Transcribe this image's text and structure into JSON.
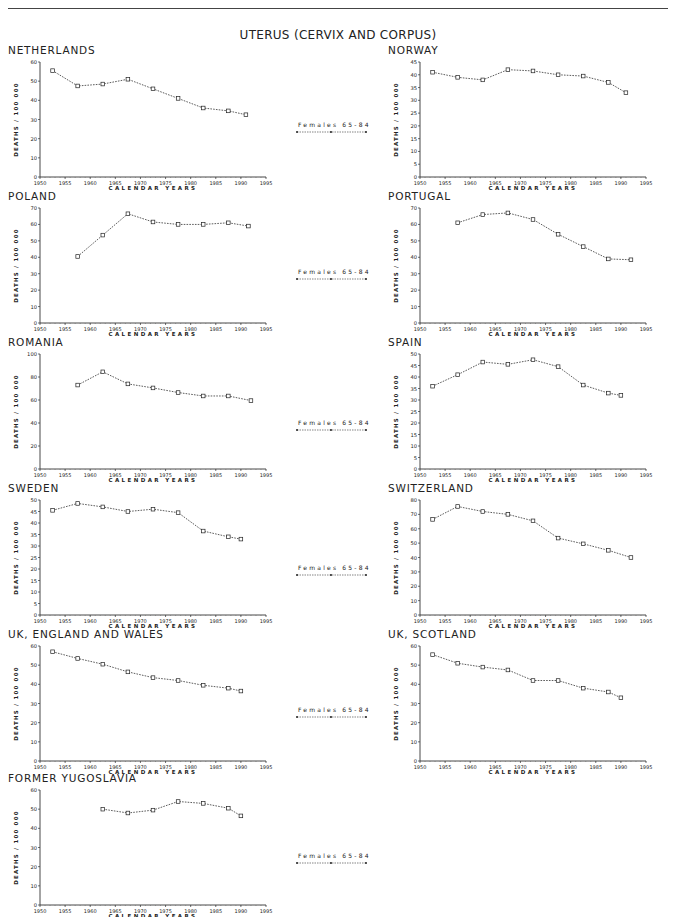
{
  "page": {
    "title": "UTERUS (CERVIX AND CORPUS)",
    "legend_label": "Females 65-84"
  },
  "chart_data": [
    {
      "type": "line",
      "title": "NETHERLANDS",
      "xlabel": "CALENDAR YEARS",
      "ylabel": "DEATHS / 100 000",
      "xlim": [
        1950,
        1995
      ],
      "ylim": [
        0,
        60
      ],
      "yticks": [
        0,
        10,
        20,
        30,
        40,
        50,
        60
      ],
      "xticks": [
        1950,
        1955,
        1960,
        1965,
        1970,
        1975,
        1980,
        1985,
        1990,
        1995
      ],
      "grid": false,
      "series": [
        {
          "name": "Females 65-84",
          "x": [
            1952.5,
            1957.5,
            1962.5,
            1967.5,
            1972.5,
            1977.5,
            1982.5,
            1987.5,
            1991
          ],
          "values": [
            55.5,
            47.5,
            48.5,
            51,
            46,
            41,
            36,
            34.5,
            32.5
          ]
        }
      ]
    },
    {
      "type": "line",
      "title": "NORWAY",
      "xlabel": "CALENDAR YEARS",
      "ylabel": "DEATHS / 100 000",
      "xlim": [
        1950,
        1995
      ],
      "ylim": [
        0,
        45
      ],
      "yticks": [
        0,
        5,
        10,
        15,
        20,
        25,
        30,
        35,
        40,
        45
      ],
      "xticks": [
        1950,
        1955,
        1960,
        1965,
        1970,
        1975,
        1980,
        1985,
        1990,
        1995
      ],
      "grid": false,
      "series": [
        {
          "name": "Females 65-84",
          "x": [
            1952.5,
            1957.5,
            1962.5,
            1967.5,
            1972.5,
            1977.5,
            1982.5,
            1987.5,
            1991
          ],
          "values": [
            41,
            39,
            38,
            42,
            41.5,
            40,
            39.5,
            37,
            33
          ]
        }
      ]
    },
    {
      "type": "line",
      "title": "POLAND",
      "xlabel": "CALENDAR YEARS",
      "ylabel": "DEATHS / 100 000",
      "xlim": [
        1950,
        1995
      ],
      "ylim": [
        0,
        70
      ],
      "yticks": [
        0,
        10,
        20,
        30,
        40,
        50,
        60,
        70
      ],
      "xticks": [
        1950,
        1955,
        1960,
        1965,
        1970,
        1975,
        1980,
        1985,
        1990,
        1995
      ],
      "grid": false,
      "series": [
        {
          "name": "Females 65-84",
          "x": [
            1957.5,
            1962.5,
            1967.5,
            1972.5,
            1977.5,
            1982.5,
            1987.5,
            1991.5
          ],
          "values": [
            40.5,
            53.5,
            66.5,
            61.5,
            60,
            60,
            61,
            59
          ]
        }
      ]
    },
    {
      "type": "line",
      "title": "PORTUGAL",
      "xlabel": "CALENDAR YEARS",
      "ylabel": "DEATHS / 100 000",
      "xlim": [
        1950,
        1995
      ],
      "ylim": [
        0,
        70
      ],
      "yticks": [
        0,
        10,
        20,
        30,
        40,
        50,
        60,
        70
      ],
      "xticks": [
        1950,
        1955,
        1960,
        1965,
        1970,
        1975,
        1980,
        1985,
        1990,
        1995
      ],
      "grid": false,
      "series": [
        {
          "name": "Females 65-84",
          "x": [
            1957.5,
            1962.5,
            1967.5,
            1972.5,
            1977.5,
            1982.5,
            1987.5,
            1992
          ],
          "values": [
            61,
            66,
            67,
            63,
            54,
            46.5,
            39,
            38.5
          ]
        }
      ]
    },
    {
      "type": "line",
      "title": "ROMANIA",
      "xlabel": "CALENDAR YEARS",
      "ylabel": "DEATHS / 100 000",
      "xlim": [
        1950,
        1995
      ],
      "ylim": [
        0,
        100
      ],
      "yticks": [
        0,
        20,
        40,
        60,
        80,
        100
      ],
      "xticks": [
        1950,
        1955,
        1960,
        1965,
        1970,
        1975,
        1980,
        1985,
        1990,
        1995
      ],
      "grid": false,
      "series": [
        {
          "name": "Females 65-84",
          "x": [
            1957.5,
            1962.5,
            1967.5,
            1972.5,
            1977.5,
            1982.5,
            1987.5,
            1992
          ],
          "values": [
            73,
            84.5,
            74,
            70.5,
            66.5,
            63.5,
            63.5,
            59.5
          ]
        }
      ]
    },
    {
      "type": "line",
      "title": "SPAIN",
      "xlabel": "CALENDAR YEARS",
      "ylabel": "DEATHS / 100 000",
      "xlim": [
        1950,
        1995
      ],
      "ylim": [
        0,
        50
      ],
      "yticks": [
        0,
        5,
        10,
        15,
        20,
        25,
        30,
        35,
        40,
        45,
        50
      ],
      "xticks": [
        1950,
        1955,
        1960,
        1965,
        1970,
        1975,
        1980,
        1985,
        1990,
        1995
      ],
      "grid": false,
      "series": [
        {
          "name": "Females 65-84",
          "x": [
            1952.5,
            1957.5,
            1962.5,
            1967.5,
            1972.5,
            1977.5,
            1982.5,
            1987.5,
            1990
          ],
          "values": [
            36,
            41,
            46.5,
            45.5,
            47.5,
            44.5,
            36.5,
            33,
            32
          ]
        }
      ]
    },
    {
      "type": "line",
      "title": "SWEDEN",
      "xlabel": "CALENDAR YEARS",
      "ylabel": "DEATHS / 100 000",
      "xlim": [
        1950,
        1995
      ],
      "ylim": [
        0,
        50
      ],
      "yticks": [
        0,
        5,
        10,
        15,
        20,
        25,
        30,
        35,
        40,
        45,
        50
      ],
      "xticks": [
        1950,
        1955,
        1960,
        1965,
        1970,
        1975,
        1980,
        1985,
        1990,
        1995
      ],
      "grid": false,
      "series": [
        {
          "name": "Females 65-84",
          "x": [
            1952.5,
            1957.5,
            1962.5,
            1967.5,
            1972.5,
            1977.5,
            1982.5,
            1987.5,
            1990
          ],
          "values": [
            45.5,
            48.5,
            47,
            45,
            46,
            44.5,
            36.5,
            34,
            33
          ]
        }
      ]
    },
    {
      "type": "line",
      "title": "SWITZERLAND",
      "xlabel": "CALENDAR YEARS",
      "ylabel": "DEATHS / 100 000",
      "xlim": [
        1950,
        1995
      ],
      "ylim": [
        0,
        80
      ],
      "yticks": [
        0,
        10,
        20,
        30,
        40,
        50,
        60,
        70,
        80
      ],
      "xticks": [
        1950,
        1955,
        1960,
        1965,
        1970,
        1975,
        1980,
        1985,
        1990,
        1995
      ],
      "grid": false,
      "series": [
        {
          "name": "Females 65-84",
          "x": [
            1952.5,
            1957.5,
            1962.5,
            1967.5,
            1972.5,
            1977.5,
            1982.5,
            1987.5,
            1992
          ],
          "values": [
            66.5,
            75.5,
            72,
            70,
            65.5,
            53.5,
            49.5,
            45,
            40
          ]
        }
      ]
    },
    {
      "type": "line",
      "title": "UK, ENGLAND AND WALES",
      "xlabel": "CALENDAR YEARS",
      "ylabel": "DEATHS / 100 000",
      "xlim": [
        1950,
        1995
      ],
      "ylim": [
        0,
        60
      ],
      "yticks": [
        0,
        10,
        20,
        30,
        40,
        50,
        60
      ],
      "xticks": [
        1950,
        1955,
        1960,
        1965,
        1970,
        1975,
        1980,
        1985,
        1990,
        1995
      ],
      "grid": false,
      "series": [
        {
          "name": "Females 65-84",
          "x": [
            1952.5,
            1957.5,
            1962.5,
            1967.5,
            1972.5,
            1977.5,
            1982.5,
            1987.5,
            1990
          ],
          "values": [
            57,
            53.5,
            50.5,
            46.5,
            43.5,
            42,
            39.5,
            38,
            36.5
          ]
        }
      ]
    },
    {
      "type": "line",
      "title": "UK, SCOTLAND",
      "xlabel": "CALENDAR YEARS",
      "ylabel": "DEATHS / 100 000",
      "xlim": [
        1950,
        1995
      ],
      "ylim": [
        0,
        60
      ],
      "yticks": [
        0,
        10,
        20,
        30,
        40,
        50,
        60
      ],
      "xticks": [
        1950,
        1955,
        1960,
        1965,
        1970,
        1975,
        1980,
        1985,
        1990,
        1995
      ],
      "grid": false,
      "series": [
        {
          "name": "Females 65-84",
          "x": [
            1952.5,
            1957.5,
            1962.5,
            1967.5,
            1972.5,
            1977.5,
            1982.5,
            1987.5,
            1990
          ],
          "values": [
            55.5,
            51,
            49,
            47.5,
            42,
            42,
            38,
            36,
            33
          ]
        }
      ]
    },
    {
      "type": "line",
      "title": "FORMER YUGOSLAVIA",
      "xlabel": "CALENDAR YEARS",
      "ylabel": "DEATHS / 100 000",
      "xlim": [
        1950,
        1995
      ],
      "ylim": [
        0,
        60
      ],
      "yticks": [
        0,
        10,
        20,
        30,
        40,
        50,
        60
      ],
      "xticks": [
        1950,
        1955,
        1960,
        1965,
        1970,
        1975,
        1980,
        1985,
        1990,
        1995
      ],
      "grid": false,
      "series": [
        {
          "name": "Females 65-84",
          "x": [
            1962.5,
            1967.5,
            1972.5,
            1977.5,
            1982.5,
            1987.5,
            1990
          ],
          "values": [
            50,
            48,
            49.5,
            54,
            53,
            50.5,
            46.5
          ]
        }
      ]
    }
  ],
  "layout": {
    "panels": [
      {
        "left": 4,
        "top": 44
      },
      {
        "left": 384,
        "top": 44
      },
      {
        "left": 4,
        "top": 190
      },
      {
        "left": 384,
        "top": 190
      },
      {
        "left": 4,
        "top": 336
      },
      {
        "left": 384,
        "top": 336
      },
      {
        "left": 4,
        "top": 482
      },
      {
        "left": 384,
        "top": 482
      },
      {
        "left": 4,
        "top": 628
      },
      {
        "left": 384,
        "top": 628
      },
      {
        "left": 4,
        "top": 772
      }
    ],
    "legends": [
      {
        "left": 296,
        "top": 121
      },
      {
        "left": 296,
        "top": 268
      },
      {
        "left": 296,
        "top": 419
      },
      {
        "left": 296,
        "top": 564
      },
      {
        "left": 296,
        "top": 706
      },
      {
        "left": 296,
        "top": 852
      }
    ]
  }
}
